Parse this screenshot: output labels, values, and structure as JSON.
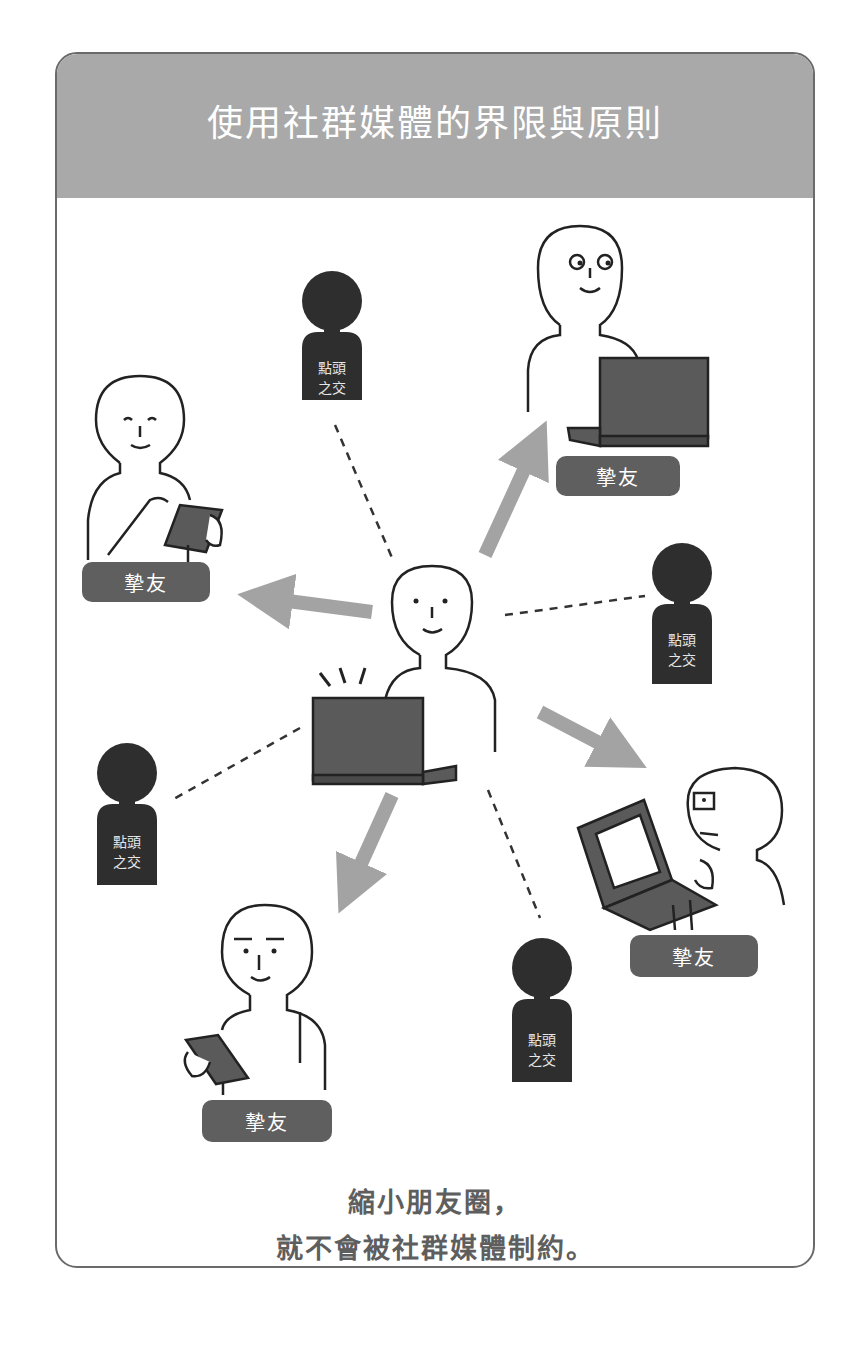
{
  "header": {
    "title": "使用社群媒體的界限與原則"
  },
  "center_person": {
    "role": "self",
    "device": "laptop"
  },
  "close_friends": [
    {
      "label": "摯友",
      "position": "top-right",
      "device": "laptop"
    },
    {
      "label": "摯友",
      "position": "left",
      "device": "phone"
    },
    {
      "label": "摯友",
      "position": "right",
      "device": "laptop-glasses"
    },
    {
      "label": "摯友",
      "position": "bottom-left",
      "device": "phone"
    }
  ],
  "acquaintances": [
    {
      "label_line1": "點頭",
      "label_line2": "之交",
      "position": "top"
    },
    {
      "label_line1": "點頭",
      "label_line2": "之交",
      "position": "right"
    },
    {
      "label_line1": "點頭",
      "label_line2": "之交",
      "position": "left"
    },
    {
      "label_line1": "點頭",
      "label_line2": "之交",
      "position": "bottom"
    }
  ],
  "caption": {
    "line1": "縮小朋友圈，",
    "line2": "就不會被社群媒體制約。"
  },
  "colors": {
    "header_bg": "#a9a9a9",
    "badge_bg": "#5f5f5f",
    "silhouette": "#2e2e2e",
    "arrow": "#a3a3a3",
    "device": "#5a5a5a",
    "caption_text": "#5e5e5e"
  }
}
